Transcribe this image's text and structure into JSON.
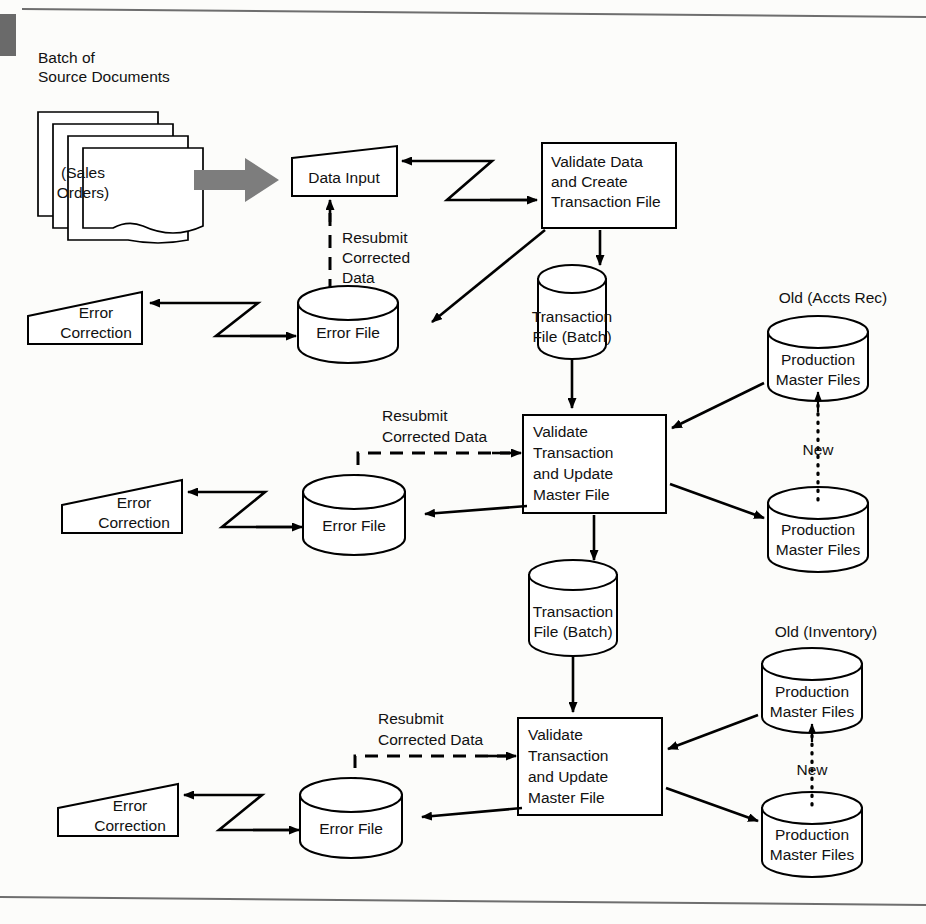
{
  "diagram": {
    "type": "system-flowchart",
    "stages": 3
  },
  "frame": {
    "top_rule": true,
    "bottom_rule": true,
    "left_gray_bar": true
  },
  "stage1": {
    "source_caption_line1": "Batch of",
    "source_caption_line2": "Source Documents",
    "document_label_line1": "(Sales",
    "document_label_line2": "Orders)",
    "document_count": 4,
    "data_input_label": "Data Input",
    "process_line1": "Validate Data",
    "process_line2": "and Create",
    "process_line3": "Transaction File",
    "resubmit_line1": "Resubmit",
    "resubmit_line2": "Corrected",
    "resubmit_line3": "Data",
    "error_correction_line1": "Error",
    "error_correction_line2": "Correction",
    "error_file_label": "Error File",
    "transaction_file_line1": "Transaction",
    "transaction_file_line2": "File (Batch)"
  },
  "stage2": {
    "process_line1": "Validate",
    "process_line2": "Transaction",
    "process_line3": "and Update",
    "process_line4": "Master File",
    "resubmit_line1": "Resubmit",
    "resubmit_line2": "Corrected Data",
    "error_correction_line1": "Error",
    "error_correction_line2": "Correction",
    "error_file_label": "Error File",
    "transaction_file_line1": "Transaction",
    "transaction_file_line2": "File (Batch)",
    "master_old_caption": "Old (Accts Rec)",
    "master_old_line1": "Production",
    "master_old_line2": "Master Files",
    "master_new_line1": "Production",
    "master_new_line2": "Master Files",
    "new_label": "New"
  },
  "stage3": {
    "process_line1": "Validate",
    "process_line2": "Transaction",
    "process_line3": "and Update",
    "process_line4": "Master File",
    "resubmit_line1": "Resubmit",
    "resubmit_line2": "Corrected Data",
    "error_correction_line1": "Error",
    "error_correction_line2": "Correction",
    "error_file_label": "Error File",
    "master_old_caption": "Old (Inventory)",
    "master_old_line1": "Production",
    "master_old_line2": "Master Files",
    "master_new_line1": "Production",
    "master_new_line2": "Master Files",
    "new_label": "New"
  },
  "colors": {
    "ink": "#000000",
    "paper": "#fcfcfa",
    "gray_arrow": "#7d7d7d",
    "frame_rule": "#6e6e6e"
  }
}
